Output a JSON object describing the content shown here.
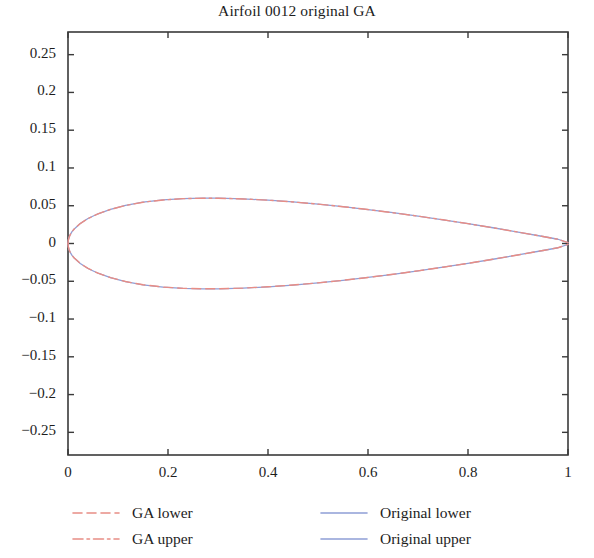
{
  "chart_data": {
    "type": "line",
    "title": "Airfoil 0012 original GA",
    "xlabel": "",
    "ylabel": "",
    "xlim": [
      0,
      1
    ],
    "ylim": [
      -0.28,
      0.28
    ],
    "xticks": [
      "0",
      "0.2",
      "0.4",
      "0.6",
      "0.8",
      "1"
    ],
    "xtick_values": [
      0,
      0.2,
      0.4,
      0.6,
      0.8,
      1
    ],
    "yticks": [
      "0.25",
      "0.2",
      "0.15",
      "0.1",
      "0.05",
      "0",
      "−0.05",
      "−0.1",
      "−0.15",
      "−0.2",
      "−0.25"
    ],
    "ytick_values": [
      0.25,
      0.2,
      0.15,
      0.1,
      0.05,
      0,
      -0.05,
      -0.1,
      -0.15,
      -0.2,
      -0.25
    ],
    "grid": false,
    "legend_position": "below-axes-two-columns",
    "x": [
      0.0,
      0.0005,
      0.002,
      0.0045,
      0.008,
      0.0125,
      0.0245,
      0.04,
      0.06,
      0.085,
      0.115,
      0.15,
      0.19,
      0.23,
      0.27,
      0.3,
      0.35,
      0.4,
      0.45,
      0.5,
      0.55,
      0.6,
      0.65,
      0.7,
      0.75,
      0.8,
      0.85,
      0.9,
      0.95,
      0.98,
      1.0
    ],
    "series": [
      {
        "name": "Original upper",
        "color": "#8f9ed6",
        "style": "solid",
        "values": [
          0.0,
          0.00404,
          0.00798,
          0.01185,
          0.01562,
          0.01931,
          0.02646,
          0.03312,
          0.03936,
          0.04521,
          0.05042,
          0.0547,
          0.05769,
          0.05938,
          0.05998,
          0.05996,
          0.05905,
          0.05737,
          0.05504,
          0.05215,
          0.04877,
          0.04496,
          0.04077,
          0.03624,
          0.0314,
          0.02626,
          0.02085,
          0.01518,
          0.00927,
          0.00563,
          0.00126
        ]
      },
      {
        "name": "Original lower",
        "color": "#8f9ed6",
        "style": "solid",
        "values": [
          0.0,
          -0.00404,
          -0.00798,
          -0.01185,
          -0.01562,
          -0.01931,
          -0.02646,
          -0.03312,
          -0.03936,
          -0.04521,
          -0.05042,
          -0.0547,
          -0.05769,
          -0.05938,
          -0.05998,
          -0.05996,
          -0.05905,
          -0.05737,
          -0.05504,
          -0.05215,
          -0.04877,
          -0.04496,
          -0.04077,
          -0.03624,
          -0.0314,
          -0.02626,
          -0.02085,
          -0.01518,
          -0.00927,
          -0.00563,
          -0.00126
        ]
      },
      {
        "name": "GA upper",
        "color": "#e88d85",
        "style": "dashdot",
        "values": [
          0.0,
          0.00398,
          0.00789,
          0.01176,
          0.01553,
          0.01925,
          0.02639,
          0.03305,
          0.03929,
          0.04515,
          0.05035,
          0.05464,
          0.05765,
          0.05935,
          0.05995,
          0.05993,
          0.05901,
          0.05734,
          0.05501,
          0.05212,
          0.04874,
          0.04493,
          0.04074,
          0.03621,
          0.03138,
          0.02624,
          0.02083,
          0.01516,
          0.00925,
          0.00561,
          0.00124
        ]
      },
      {
        "name": "GA lower",
        "color": "#e88d85",
        "style": "dashed",
        "values": [
          0.0,
          -0.00398,
          -0.00789,
          -0.01176,
          -0.01553,
          -0.01925,
          -0.02639,
          -0.03305,
          -0.03929,
          -0.04515,
          -0.05035,
          -0.05464,
          -0.05765,
          -0.05935,
          -0.05995,
          -0.05993,
          -0.05901,
          -0.05734,
          -0.05501,
          -0.05212,
          -0.04874,
          -0.04493,
          -0.04074,
          -0.03621,
          -0.03138,
          -0.02624,
          -0.02083,
          -0.01516,
          -0.00925,
          -0.00561,
          -0.00124
        ]
      }
    ]
  },
  "legend": {
    "left": [
      {
        "label": "GA lower",
        "color": "#e88d85",
        "style": "dashed"
      },
      {
        "label": "GA upper",
        "color": "#e88d85",
        "style": "dashdot"
      }
    ],
    "right": [
      {
        "label": "Original lower",
        "color": "#8f9ed6",
        "style": "solid"
      },
      {
        "label": "Original upper",
        "color": "#8f9ed6",
        "style": "solid"
      }
    ]
  },
  "axes": {
    "frame_color": "#3a3a3a"
  }
}
